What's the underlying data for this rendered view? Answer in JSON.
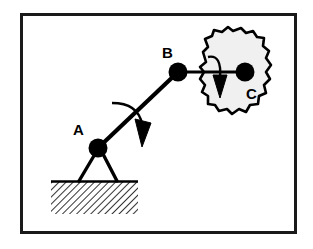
{
  "figure": {
    "type": "engineering-mechanics-diagram",
    "canvas": {
      "width": 313,
      "height": 249
    },
    "colors": {
      "stroke": "#000000",
      "background": "#ffffff",
      "body_fill": "#f0f0f0",
      "frame": "#1a1a1a"
    },
    "frame": {
      "x": 20,
      "y": 13,
      "width": 277,
      "height": 221,
      "stroke_width": 3
    }
  },
  "joints": [
    {
      "id": "A",
      "label": "A",
      "kind": "pin-support",
      "cx": 98,
      "cy": 148,
      "r": 9,
      "label_x": 73,
      "label_y": 135
    },
    {
      "id": "B",
      "label": "B",
      "kind": "revolute-joint",
      "cx": 178,
      "cy": 72,
      "r": 9,
      "label_x": 162,
      "label_y": 58
    },
    {
      "id": "C",
      "label": "C",
      "kind": "body-center-point",
      "cx": 245,
      "cy": 72,
      "r": 9,
      "label_x": 248,
      "label_y": 97
    }
  ],
  "links": [
    {
      "id": "AB",
      "from": "A",
      "to": "B",
      "x1": 98,
      "y1": 148,
      "x2": 178,
      "y2": 72,
      "stroke_width": 4
    },
    {
      "id": "BC",
      "from": "B",
      "to": "C",
      "x1": 178,
      "y1": 72,
      "x2": 245,
      "y2": 72,
      "stroke_width": 3
    }
  ],
  "support": {
    "kind": "pin-on-ground",
    "legs": [
      {
        "x1": 95,
        "y1": 155,
        "x2": 79,
        "y2": 181
      },
      {
        "x1": 103,
        "y1": 155,
        "x2": 117,
        "y2": 181
      }
    ],
    "ground": {
      "x": 51,
      "y": 181,
      "width": 87,
      "height": 33,
      "hatch_angle_deg": 45,
      "hatch_spacing": 5
    }
  },
  "rotation_arrows": [
    {
      "id": "crank-rotation",
      "describes": "rotation of link AB about A",
      "path": "M 112 103 Q 137 104 142 131",
      "tip_x": 142,
      "tip_y": 131,
      "direction": "clockwise"
    },
    {
      "id": "body-rotation",
      "describes": "rotation of rigid body C",
      "path": "M 209 56 Q 222 55 220 84",
      "tip_x": 220,
      "tip_y": 84,
      "direction": "clockwise"
    }
  ],
  "rigid_body": {
    "id": "C",
    "label": "C",
    "kind": "irregular-blob",
    "fill": "#f0f0f0",
    "stroke_width": 2.5,
    "outline": "M 206 62 L 203 52 L 208 47 L 205 39 L 212 36 L 214 30 L 222 32 L 228 27 L 233 31 L 241 28 L 246 33 L 253 31 L 257 37 L 264 38 L 263 46 L 269 51 L 266 58 L 271 65 L 266 72 L 270 79 L 264 85 L 266 93 L 259 96 L 258 104 L 250 105 L 246 112 L 239 109 L 232 114 L 227 109 L 219 111 L 215 105 L 208 104 L 208 96 L 202 92 L 205 85 L 200 79 L 204 72 L 200 67 Z"
  }
}
